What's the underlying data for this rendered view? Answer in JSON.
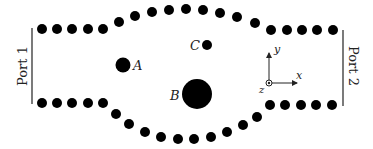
{
  "diagram": {
    "colors": {
      "dot": "#000000",
      "line": "#333333",
      "text": "#222222",
      "background": "#ffffff"
    },
    "ports": [
      {
        "label": "Port 1",
        "line": {
          "x": 32,
          "y1": 28,
          "y2": 104
        },
        "text_x": 23,
        "text_y": 66,
        "rotate": -90
      },
      {
        "label": "Port 2",
        "line": {
          "x": 343,
          "y1": 30,
          "y2": 106
        },
        "text_x": 352,
        "text_y": 66,
        "rotate": 90
      }
    ],
    "scatterers": [
      {
        "label": "A",
        "cx": 123,
        "cy": 65,
        "r": 7.5,
        "label_x": 133,
        "label_y": 70
      },
      {
        "label": "B",
        "cx": 197,
        "cy": 94,
        "r": 15,
        "label_x": 170,
        "label_y": 100
      },
      {
        "label": "C",
        "cx": 207,
        "cy": 45,
        "r": 5,
        "label_x": 190,
        "label_y": 50
      }
    ],
    "axes": {
      "origin": {
        "x": 269,
        "y": 83
      },
      "x_label": "x",
      "y_label": "y",
      "z_label": "z"
    },
    "top_wall_dots": [
      [
        42,
        29
      ],
      [
        57,
        29
      ],
      [
        72,
        29
      ],
      [
        88,
        29
      ],
      [
        103,
        29
      ],
      [
        119,
        22
      ],
      [
        135,
        16
      ],
      [
        152,
        12
      ],
      [
        169,
        10
      ],
      [
        186,
        9
      ],
      [
        203,
        10
      ],
      [
        220,
        13
      ],
      [
        237,
        17
      ],
      [
        255,
        23
      ],
      [
        271,
        30
      ],
      [
        287,
        30
      ],
      [
        302,
        30
      ],
      [
        317,
        30
      ],
      [
        333,
        30
      ]
    ],
    "bottom_wall_dots": [
      [
        42,
        103
      ],
      [
        57,
        103
      ],
      [
        72,
        103
      ],
      [
        88,
        103
      ],
      [
        103,
        103
      ],
      [
        116,
        114
      ],
      [
        129,
        124
      ],
      [
        145,
        132
      ],
      [
        161,
        137
      ],
      [
        178,
        139
      ],
      [
        194,
        139
      ],
      [
        211,
        137
      ],
      [
        227,
        132
      ],
      [
        243,
        125
      ],
      [
        257,
        117
      ],
      [
        270,
        105
      ],
      [
        285,
        105
      ],
      [
        301,
        105
      ],
      [
        316,
        105
      ],
      [
        332,
        105
      ]
    ],
    "wall_dot_radius": 5
  }
}
